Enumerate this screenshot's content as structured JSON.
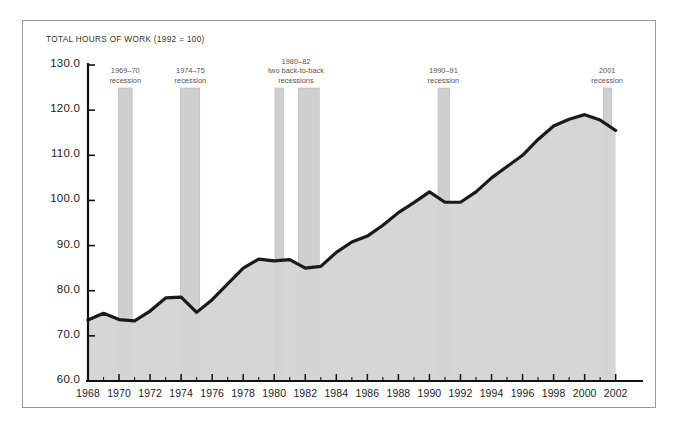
{
  "chart_data": {
    "type": "area",
    "title": "TOTAL HOURS OF WORK (1992 = 100)",
    "xlabel": "",
    "ylabel": "",
    "xlim": [
      1968,
      2002.6
    ],
    "ylim": [
      60.0,
      130.0
    ],
    "grid": false,
    "legend_position": "none",
    "y_ticks": [
      "130.0",
      "120.0",
      "110.0",
      "100.0",
      "90.0",
      "80.0",
      "70.0",
      "60.0"
    ],
    "y_tick_values": [
      130.0,
      120.0,
      110.0,
      100.0,
      90.0,
      80.0,
      70.0,
      60.0
    ],
    "x_ticks": [
      "1968",
      "1970",
      "1972",
      "1974",
      "1976",
      "1978",
      "1980",
      "1982",
      "1984",
      "1986",
      "1988",
      "1990",
      "1992",
      "1994",
      "1996",
      "1998",
      "2000",
      "2002"
    ],
    "x_tick_values": [
      1968,
      1970,
      1972,
      1974,
      1976,
      1978,
      1980,
      1982,
      1984,
      1986,
      1988,
      1990,
      1992,
      1994,
      1996,
      1998,
      2000,
      2002
    ],
    "x": [
      1968,
      1969,
      1970,
      1971,
      1972,
      1973,
      1974,
      1975,
      1976,
      1977,
      1978,
      1979,
      1980,
      1981,
      1982,
      1983,
      1984,
      1985,
      1986,
      1987,
      1988,
      1989,
      1990,
      1991,
      1992,
      1993,
      1994,
      1995,
      1996,
      1997,
      1998,
      1999,
      2000,
      2001,
      2002
    ],
    "values": [
      73.5,
      75.0,
      73.6,
      73.3,
      75.5,
      78.4,
      78.6,
      75.2,
      78.0,
      81.5,
      85.0,
      87.0,
      86.6,
      86.9,
      85.0,
      85.4,
      88.5,
      90.8,
      92.1,
      94.5,
      97.3,
      99.5,
      101.9,
      99.6,
      99.6,
      101.9,
      105.0,
      107.5,
      110.0,
      113.5,
      116.5,
      118.0,
      119.0,
      117.8,
      115.5
    ],
    "series_name": "Total hours of work",
    "line_color": "#1a1a1a",
    "fill_color": "#d4d4d4",
    "recession_band_color": "#cfcfcf",
    "annotations": [
      {
        "id": "rec-1969-70",
        "label_line1": "1969–70",
        "label_line2": "recession",
        "start": 1969.95,
        "end": 1970.85,
        "label_x": 1970.4
      },
      {
        "id": "rec-1974-75",
        "label_line1": "1974–75",
        "label_line2": "recession",
        "start": 1973.95,
        "end": 1975.2,
        "label_x": 1974.6
      },
      {
        "id": "rec-1980-82",
        "label_line1": "1980–82",
        "label_line2": "two back-to-back",
        "label_line3": "recessions",
        "start": 1980.05,
        "end": 1980.6,
        "label_x": 1981.4
      },
      {
        "id": "rec-1981-82-second",
        "label_line1": "",
        "label_line2": "",
        "start": 1981.55,
        "end": 1982.9,
        "label_x": 1982.2
      },
      {
        "id": "rec-1990-91",
        "label_line1": "1990–91",
        "label_line2": "recession",
        "start": 1990.55,
        "end": 1991.3,
        "label_x": 1990.9
      },
      {
        "id": "rec-2001",
        "label_line1": "2001",
        "label_line2": "recession",
        "start": 2001.2,
        "end": 2001.75,
        "label_x": 2001.45
      }
    ]
  }
}
